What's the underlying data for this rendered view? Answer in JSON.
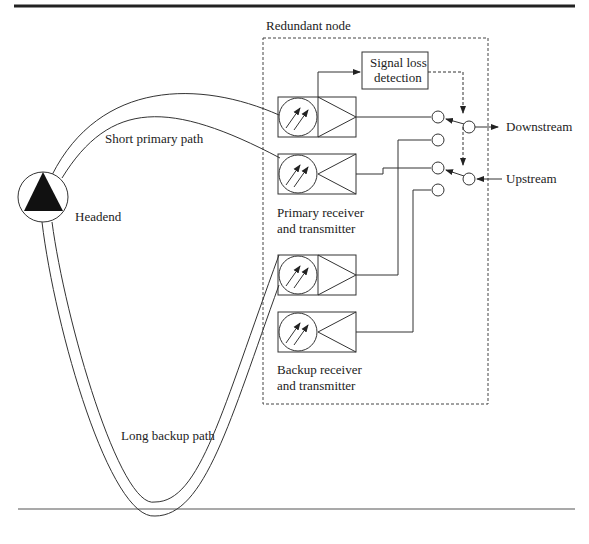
{
  "diagram": {
    "labels": {
      "redundant_node": "Redundant node",
      "signal_loss": [
        "Signal loss",
        "detection"
      ],
      "short_primary": "Short primary path",
      "headend": "Headend",
      "primary_rt": [
        "Primary receiver",
        "and transmitter"
      ],
      "backup_rt": [
        "Backup receiver",
        "and transmitter"
      ],
      "long_backup": "Long backup path",
      "downstream": "Downstream",
      "upstream": "Upstream"
    },
    "colors": {
      "line": "#333333",
      "fill": "#111111",
      "rule": "#222222"
    }
  }
}
